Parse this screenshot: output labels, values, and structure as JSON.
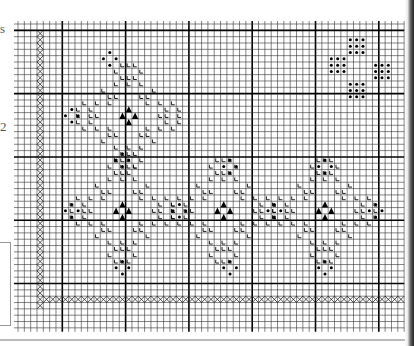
{
  "page": {
    "edge_text": [
      "s",
      "2"
    ]
  },
  "grid": {
    "origin_x": 18,
    "origin_y": 24,
    "cell": 6.33,
    "cols": 61,
    "rows": 48,
    "bold_every": 10,
    "bold_col_offset": 7,
    "bold_row_offset": 1,
    "line_color": "#333333",
    "bold_color": "#000000"
  },
  "symbols": {
    "half_stitch": "L",
    "dot": "•",
    "triangle": "▲",
    "cross": "✕"
  },
  "chart_data": {
    "type": "table",
    "border_cross_left": {
      "col": 3,
      "row_start": 1,
      "row_end": 44
    },
    "border_cross_bottom": {
      "row": 43,
      "col_start": 4,
      "col_end": 60
    },
    "motif_centers": [
      {
        "col": 17,
        "row": 14
      },
      {
        "col": 16,
        "row": 29
      },
      {
        "col": 32,
        "row": 29
      },
      {
        "col": 48,
        "row": 29
      }
    ],
    "dot_clusters": [
      {
        "col": 14,
        "row": 5
      },
      {
        "col": 8,
        "row": 14
      },
      {
        "col": 16,
        "row": 21
      },
      {
        "col": 8,
        "row": 29
      },
      {
        "col": 16,
        "row": 38
      },
      {
        "col": 33,
        "row": 22
      },
      {
        "col": 25,
        "row": 29
      },
      {
        "col": 40,
        "row": 29
      },
      {
        "col": 33,
        "row": 38
      },
      {
        "col": 48,
        "row": 22
      },
      {
        "col": 48,
        "row": 38
      },
      {
        "col": 56,
        "row": 29
      }
    ],
    "dot_flower_clusters": [
      {
        "col": 53,
        "row": 3
      },
      {
        "col": 50,
        "row": 6
      },
      {
        "col": 57,
        "row": 7
      },
      {
        "col": 53,
        "row": 10
      }
    ]
  }
}
